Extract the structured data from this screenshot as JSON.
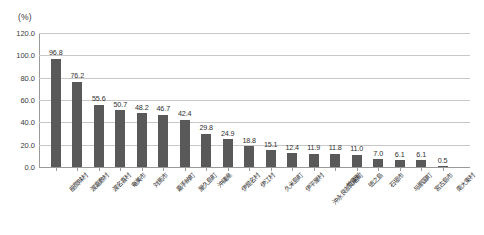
{
  "chart_data": {
    "type": "bar",
    "title": "",
    "subtitle": "",
    "unit_caption": "(%)",
    "xlabel": "",
    "ylabel": "",
    "ylim": [
      0.0,
      120.0
    ],
    "yticks": [
      "0.0",
      "20.0",
      "40.0",
      "60.0",
      "80.0",
      "100.0",
      "120.0"
    ],
    "ytick_values": [
      0.0,
      20.0,
      40.0,
      60.0,
      80.0,
      100.0,
      120.0
    ],
    "grid": true,
    "legend": false,
    "legend_position": "none",
    "bar_color": "#595959",
    "gridline_color": "#c8c8c8",
    "axis_color": "#9a9a9a",
    "categories": [
      "座間味村",
      "渡嘉敷村",
      "渡名喜村",
      "奄美市",
      "対馬市",
      "嘉手納町",
      "屋久島町",
      "沖縄県",
      "伊是名村",
      "伊江村",
      "久米島町",
      "伊平屋村",
      "沖永良部知名町",
      "竹富町",
      "徳之島",
      "石垣市",
      "与那国町",
      "宮古島市",
      "南大東村"
    ],
    "values": [
      96.8,
      76.2,
      55.6,
      50.7,
      48.2,
      46.7,
      42.4,
      29.8,
      24.9,
      18.8,
      15.1,
      12.4,
      11.9,
      11.8,
      11.0,
      7.0,
      6.1,
      6.1,
      0.5
    ],
    "value_labels": [
      "96.8",
      "76.2",
      "55.6",
      "50.7",
      "48.2",
      "46.7",
      "42.4",
      "29.8",
      "24.9",
      "18.8",
      "15.1",
      "12.4",
      "11.9",
      "11.8",
      "11.0",
      "7.0",
      "6.1",
      "6.1",
      "0.5"
    ]
  }
}
